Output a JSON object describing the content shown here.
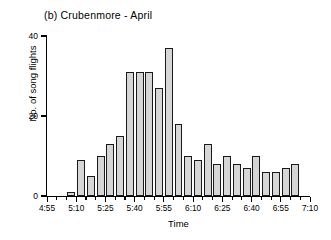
{
  "chart_data": {
    "type": "bar",
    "title": "(b)  Crubenmore - April",
    "xlabel": "Time",
    "ylabel": "No. of song flights",
    "grid": false,
    "legend": null,
    "ylim": [
      0,
      40
    ],
    "yticks": [
      0,
      20,
      40
    ],
    "ytick_labels": [
      "0",
      "20",
      "40"
    ],
    "xlim": [
      "4:55",
      "7:10"
    ],
    "xtick_labels": [
      "4:55",
      "5:10",
      "5:25",
      "5:40",
      "5:55",
      "6:10",
      "6:25",
      "6:40",
      "6:55",
      "7:10"
    ],
    "xtick_minor_interval_minutes": 5,
    "bar_interval_minutes": 5,
    "bar_fill_color": "#d6d6d6",
    "bar_edge_color": "#1a1a1a",
    "categories": [
      "4:55",
      "5:00",
      "5:05",
      "5:10",
      "5:15",
      "5:20",
      "5:25",
      "5:30",
      "5:35",
      "5:40",
      "5:45",
      "5:50",
      "5:55",
      "6:00",
      "6:05",
      "6:10",
      "6:15",
      "6:20",
      "6:25",
      "6:30",
      "6:35",
      "6:40",
      "6:45",
      "6:50",
      "6:55",
      "7:00",
      "7:05"
    ],
    "values": [
      0,
      0,
      1,
      9,
      5,
      10,
      13,
      15,
      31,
      31,
      31,
      27,
      37,
      18,
      10,
      9,
      13,
      8,
      10,
      8,
      7,
      10,
      6,
      6,
      7,
      8,
      0
    ]
  }
}
